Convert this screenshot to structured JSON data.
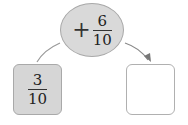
{
  "diagram": {
    "type": "fraction-addition-flow",
    "operation": {
      "sign": "+",
      "numerator": "6",
      "denominator": "10",
      "shape": "ellipse",
      "fill": "#d9d9d9"
    },
    "start": {
      "numerator": "3",
      "denominator": "10",
      "fill": "#d6d6d6"
    },
    "result": {
      "value": "",
      "fill": "#ffffff"
    },
    "colors": {
      "stroke": "#a8a8a8",
      "arrow": "#888888",
      "text": "#222222"
    }
  }
}
